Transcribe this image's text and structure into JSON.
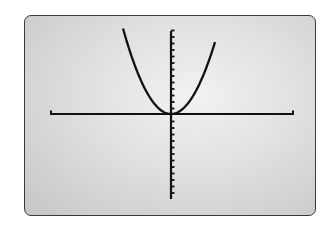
{
  "screen": {
    "type": "graphing-calculator-display",
    "bezel_color": "#3a3a3a",
    "background_color": "#dcdcdc"
  },
  "chart_data": {
    "type": "line",
    "title": "",
    "xlabel": "",
    "ylabel": "",
    "function": "y = x^2",
    "series": [
      {
        "name": "parabola",
        "color": "#111111",
        "x": [
          -3.5,
          -3,
          -2,
          -1,
          0,
          1,
          2,
          3,
          3.5
        ],
        "y": [
          12.25,
          9,
          4,
          1,
          0,
          1,
          4,
          9,
          12.25
        ]
      }
    ],
    "xlim": [
      -10,
      10
    ],
    "ylim": [
      -10,
      10
    ],
    "y_ticks_above": 13,
    "y_ticks_below": 12,
    "x_ticks": 0,
    "grid": false,
    "legend": null
  }
}
